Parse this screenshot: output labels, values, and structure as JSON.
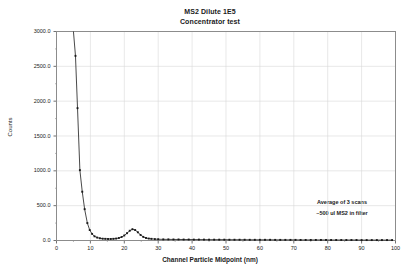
{
  "chart_data": {
    "type": "line",
    "title": "MS2 Dilute 1E5",
    "subtitle": "Concentrator test",
    "xlabel": "Channel Particle Midpoint (nm)",
    "ylabel": "Counts",
    "xlim": [
      0,
      100
    ],
    "ylim": [
      0,
      3000
    ],
    "xticks": [
      0,
      10,
      20,
      30,
      40,
      50,
      60,
      70,
      80,
      90,
      100
    ],
    "xtick_labels": [
      "0",
      "10",
      "20",
      "30",
      "40",
      "50",
      "60",
      "70",
      "80",
      "90",
      "100"
    ],
    "yticks": [
      0,
      500,
      1000,
      1500,
      2000,
      2500,
      3000
    ],
    "ytick_labels": [
      "0.0",
      "500.0",
      "1000.0",
      "1500.0",
      "2000.0",
      "2500.0",
      "3000.0"
    ],
    "grid": true,
    "legend": false,
    "marker": "square",
    "series_color": "#1a1a1a",
    "annotations": [
      "Average of 3 scans",
      "~500 ul MS2 in filter"
    ],
    "series": [
      {
        "name": "MS2 Dilute 1E5 counts",
        "x": [
          5.0,
          5.6,
          6.2,
          6.9,
          7.6,
          8.3,
          9.1,
          9.8,
          10.5,
          11.2,
          12.0,
          12.8,
          13.6,
          14.4,
          15.2,
          16.0,
          16.8,
          17.6,
          18.4,
          19.2,
          20.0,
          20.8,
          21.6,
          22.4,
          23.2,
          24.0,
          24.8,
          25.6,
          26.4,
          27.2,
          28.0,
          29.0,
          30.0,
          31.5,
          33.0,
          34.5,
          36.0,
          37.5,
          39.0,
          40.5,
          42.0,
          43.5,
          45.0,
          46.5,
          48.0,
          49.5,
          51.0,
          52.5,
          54.0,
          55.5,
          57.0,
          58.5,
          60.0,
          61.5,
          63.0,
          64.5,
          66.0,
          67.5,
          69.0,
          70.5,
          72.0,
          73.5,
          75.0,
          76.5,
          78.0,
          79.5,
          81.0,
          82.5,
          84.0,
          85.5,
          87.0,
          88.5,
          90.0,
          91.5,
          93.0,
          94.5,
          96.0,
          97.5,
          99.0
        ],
        "y": [
          3400,
          2650,
          1900,
          1010,
          700,
          450,
          250,
          150,
          95,
          60,
          42,
          32,
          26,
          24,
          22,
          22,
          24,
          28,
          36,
          50,
          72,
          105,
          140,
          162,
          150,
          118,
          80,
          52,
          36,
          28,
          24,
          20,
          18,
          16,
          16,
          15,
          15,
          14,
          14,
          13,
          13,
          13,
          12,
          12,
          12,
          12,
          11,
          11,
          11,
          11,
          10,
          10,
          10,
          10,
          10,
          9,
          9,
          9,
          9,
          9,
          8,
          8,
          8,
          8,
          8,
          8,
          7,
          7,
          7,
          7,
          7,
          7,
          6,
          6,
          6,
          6,
          6,
          6,
          6
        ]
      }
    ]
  }
}
